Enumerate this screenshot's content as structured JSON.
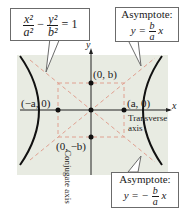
{
  "equation": {
    "x_num": "x²",
    "x_den": "a²",
    "minus": "−",
    "y_num": "y²",
    "y_den": "b²",
    "rhs": "= 1"
  },
  "asymptote_top": {
    "title": "Asymptote:",
    "lhs": "y =",
    "num": "b",
    "den": "a",
    "var": "x"
  },
  "asymptote_bottom": {
    "title": "Asymptote:",
    "lhs": "y = −",
    "num": "b",
    "den": "a",
    "var": "x"
  },
  "axes": {
    "x_label": "x",
    "y_label": "y"
  },
  "points": {
    "vertex_left": "(−a, 0)",
    "vertex_right": "(a, 0)",
    "covertex_top": "(0, b)",
    "covertex_bottom": "(0, −b)"
  },
  "axis_labels": {
    "transverse_line1": "Transverse",
    "transverse_line2": "axis",
    "conjugate": "Conjugate axis"
  },
  "colors": {
    "plot_background": "#e8ebe2",
    "curve": "#111111",
    "dashed": "#e0a090",
    "axis": "#222222"
  }
}
